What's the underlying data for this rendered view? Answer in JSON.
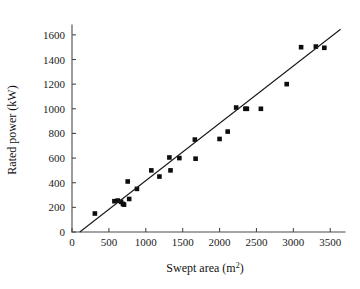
{
  "chart_data": {
    "type": "scatter",
    "title": "",
    "xlabel": "Swept area (m2)",
    "xlabel_base": "Swept area (m",
    "xlabel_sup": "2",
    "xlabel_tail": ")",
    "ylabel": "Rated power (kW)",
    "xlim": [
      0,
      3700
    ],
    "ylim": [
      0,
      1680
    ],
    "xticks": [
      0,
      500,
      1000,
      1500,
      2000,
      2500,
      3000,
      3500
    ],
    "yticks": [
      0,
      200,
      400,
      600,
      800,
      1000,
      1200,
      1400,
      1600
    ],
    "xtick_labels": [
      "0",
      "500",
      "1000",
      "1500",
      "2000",
      "2500",
      "3000",
      "3500"
    ],
    "ytick_labels": [
      "0",
      "200",
      "400",
      "600",
      "800",
      "1000",
      "1200",
      "1400",
      "1600"
    ],
    "grid": false,
    "legend": null,
    "marker_style": "filled-square",
    "marker_color": "#0d0d0d",
    "line_color": "#1c1c1c",
    "points": [
      {
        "x": 310,
        "y": 150
      },
      {
        "x": 575,
        "y": 250
      },
      {
        "x": 620,
        "y": 255
      },
      {
        "x": 665,
        "y": 245
      },
      {
        "x": 690,
        "y": 228
      },
      {
        "x": 705,
        "y": 222
      },
      {
        "x": 755,
        "y": 410
      },
      {
        "x": 775,
        "y": 268
      },
      {
        "x": 880,
        "y": 350
      },
      {
        "x": 1075,
        "y": 500
      },
      {
        "x": 1185,
        "y": 450
      },
      {
        "x": 1320,
        "y": 605
      },
      {
        "x": 1335,
        "y": 500
      },
      {
        "x": 1455,
        "y": 600
      },
      {
        "x": 1665,
        "y": 750
      },
      {
        "x": 1675,
        "y": 595
      },
      {
        "x": 2000,
        "y": 755
      },
      {
        "x": 2110,
        "y": 815
      },
      {
        "x": 2225,
        "y": 1010
      },
      {
        "x": 2350,
        "y": 1000
      },
      {
        "x": 2370,
        "y": 1000
      },
      {
        "x": 2560,
        "y": 1000
      },
      {
        "x": 2910,
        "y": 1200
      },
      {
        "x": 3105,
        "y": 1500
      },
      {
        "x": 3305,
        "y": 1505
      },
      {
        "x": 3420,
        "y": 1495
      }
    ],
    "fit_line": {
      "x_start": 105,
      "y_start": 0,
      "x_end": 3640,
      "y_end": 1645,
      "description": "linear trend line"
    }
  }
}
